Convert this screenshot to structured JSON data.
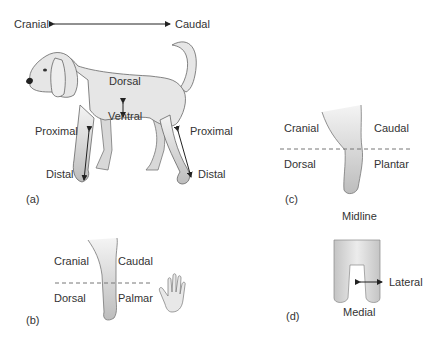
{
  "panel_a": {
    "caption": "(a)",
    "axis_left": "Cranial",
    "axis_right": "Caudal",
    "dorsal": "Dorsal",
    "ventral": "Ventral",
    "proximal_front": "Proximal",
    "distal_front": "Distal",
    "proximal_hind": "Proximal",
    "distal_hind": "Distal"
  },
  "panel_b": {
    "caption": "(b)",
    "cranial": "Cranial",
    "caudal": "Caudal",
    "dorsal": "Dorsal",
    "palmar": "Palmar"
  },
  "panel_c": {
    "caption": "(c)",
    "cranial": "Cranial",
    "caudal": "Caudal",
    "dorsal": "Dorsal",
    "plantar": "Plantar"
  },
  "panel_d": {
    "caption": "(d)",
    "midline": "Midline",
    "lateral": "Lateral",
    "medial": "Medial"
  },
  "colors": {
    "text": "#333333",
    "outline": "#555555",
    "body_fill": "#e6e6e6",
    "dash": "#777777"
  }
}
